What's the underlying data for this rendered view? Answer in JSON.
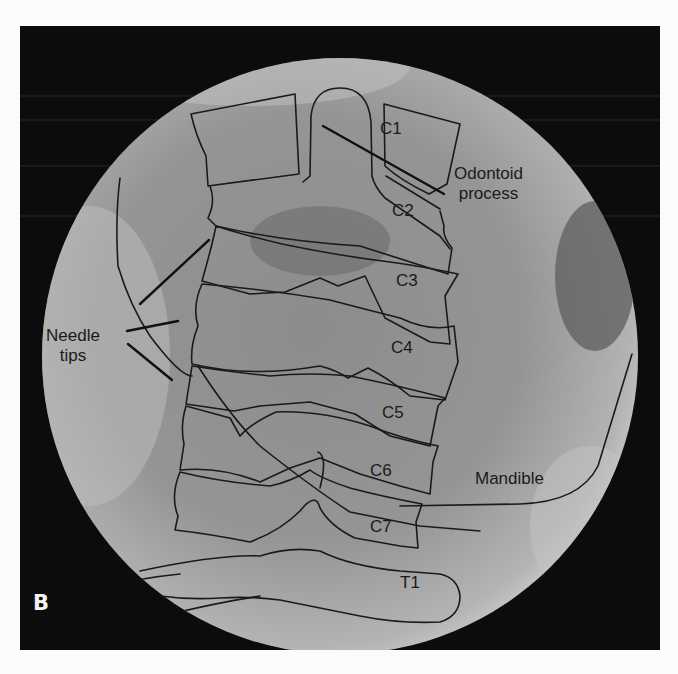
{
  "figure": {
    "panel_letter": "B",
    "imaging_type": "fluoroscopy-xray",
    "frame_color": "#0c0c0c",
    "field_color": "#9a9a9a",
    "outline_color": "#1a1a1a",
    "page_background": "#fbfbfb"
  },
  "labels": {
    "vertebrae": {
      "c1": "C1",
      "c2": "C2",
      "c3": "C3",
      "c4": "C4",
      "c5": "C5",
      "c6": "C6",
      "c7": "C7",
      "t1": "T1"
    },
    "odontoid": {
      "line1": "Odontoid",
      "line2": "process"
    },
    "needle": {
      "line1": "Needle",
      "line2": "tips"
    },
    "mandible": "Mandible"
  }
}
